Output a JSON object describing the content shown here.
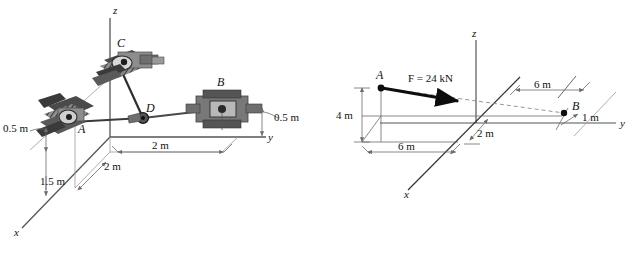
{
  "figure": {
    "caption": "",
    "panels": [
      {
        "id": "left",
        "name": "cable-bracket-assembly-3d",
        "axes": {
          "x": "x",
          "y": "y",
          "z": "z"
        },
        "points": [
          {
            "id": "A",
            "label": "A"
          },
          {
            "id": "B",
            "label": "B"
          },
          {
            "id": "C",
            "label": "C"
          },
          {
            "id": "D",
            "label": "D"
          }
        ],
        "dimensions": [
          {
            "id": "a-offset",
            "label": "0.5 m"
          },
          {
            "id": "b-offset",
            "label": "0.5 m"
          },
          {
            "id": "a-depth",
            "label": "1.5 m"
          },
          {
            "id": "a-run",
            "label": "2 m"
          },
          {
            "id": "b-run",
            "label": "2 m"
          }
        ]
      },
      {
        "id": "right",
        "name": "force-vector-3d",
        "axes": {
          "x": "x",
          "y": "y",
          "z": "z"
        },
        "points": [
          {
            "id": "A",
            "label": "A"
          },
          {
            "id": "B",
            "label": "B"
          }
        ],
        "force": {
          "label": "F = 24 kN",
          "magnitude": 24,
          "unit": "kN"
        },
        "dimensions": [
          {
            "id": "height",
            "label": "4 m"
          },
          {
            "id": "x-depth",
            "label": "6 m"
          },
          {
            "id": "y-origin",
            "label": "2 m"
          },
          {
            "id": "y-span",
            "label": "6 m"
          },
          {
            "id": "b-offset",
            "label": "1 m"
          }
        ]
      }
    ]
  },
  "colors": {
    "line": "#1a1a1a",
    "axis": "#555555",
    "dim": "#6b6b6b",
    "hardware_dark": "#3a3a3a",
    "hardware_mid": "#6e6e6e",
    "hardware_light": "#9a9a9a",
    "cable": "#4a4a4a",
    "dashed": "#8a8a8a"
  }
}
